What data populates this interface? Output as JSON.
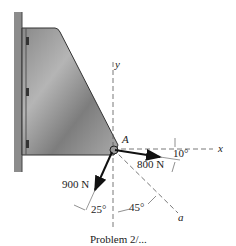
{
  "diagram": {
    "point_label": "A",
    "axes": {
      "x": "x",
      "y": "y",
      "a": "a"
    },
    "forces": [
      {
        "label": "800 N",
        "angle_label": "10°"
      },
      {
        "label": "900 N",
        "angle_label": "25°"
      }
    ],
    "a_axis_angle_label": "45°",
    "caption": "Problem 2/..."
  }
}
